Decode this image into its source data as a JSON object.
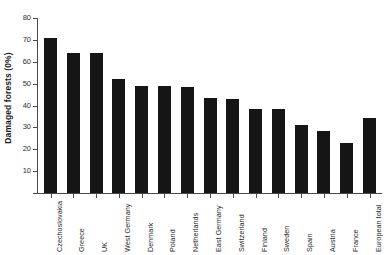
{
  "chart_data": {
    "type": "bar",
    "title": "",
    "subtitle": "",
    "xlabel": "",
    "ylabel": "Damaged forests (0%)",
    "ylim": [
      0,
      80
    ],
    "yticks": [
      0,
      10,
      20,
      30,
      40,
      50,
      60,
      70,
      80
    ],
    "ytick_labels": [
      "",
      "10",
      "20",
      "30",
      "40",
      "50",
      "60",
      "70",
      "80"
    ],
    "grid": false,
    "legend": false,
    "legend_position": "none",
    "bar_color": "#151515",
    "categories": [
      "Czechoslovakia",
      "Greece",
      "UK",
      "West Germany",
      "Denmark",
      "Poland",
      "Netherlands",
      "East Germany",
      "Switzerland",
      "Finland",
      "Sweden",
      "Spain",
      "Austria",
      "France",
      "European total"
    ],
    "values": [
      71,
      64,
      64,
      52,
      49,
      49,
      48.5,
      43.5,
      43,
      38.5,
      38.5,
      31,
      28.5,
      23,
      34.5
    ]
  },
  "axis": {
    "y_title": "Damaged forests (0%)",
    "y_tick_80": "80",
    "y_tick_70": "70",
    "y_tick_60": "60",
    "y_tick_50": "50",
    "y_tick_40": "40",
    "y_tick_30": "30",
    "y_tick_20": "20",
    "y_tick_10": "10"
  }
}
